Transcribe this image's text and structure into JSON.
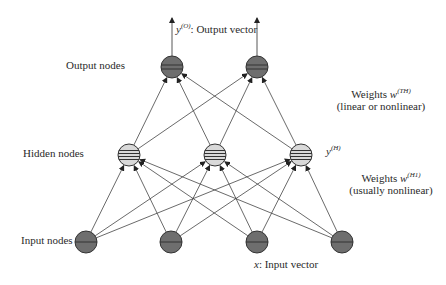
{
  "diagram": {
    "type": "neural-network",
    "title": "",
    "colors": {
      "node_dark": "#6e6e6e",
      "node_light": "#d9d9d9",
      "stroke": "#333333",
      "edge": "#444444"
    },
    "layers": {
      "output": {
        "label": "Output nodes",
        "nodes": [
          {
            "x": 172,
            "y": 67
          },
          {
            "x": 257,
            "y": 67
          }
        ],
        "vector_label": {
          "symbol": "y",
          "superscript": "(O)",
          "text": ": Output vector"
        }
      },
      "hidden": {
        "label": "Hidden nodes",
        "nodes": [
          {
            "x": 129,
            "y": 155
          },
          {
            "x": 215,
            "y": 155
          },
          {
            "x": 301,
            "y": 155
          }
        ],
        "vector_label": {
          "symbol": "y",
          "superscript": "(H)"
        }
      },
      "input": {
        "label": "Input nodes",
        "nodes": [
          {
            "x": 86,
            "y": 242
          },
          {
            "x": 171,
            "y": 242
          },
          {
            "x": 257,
            "y": 242
          },
          {
            "x": 342,
            "y": 242
          }
        ],
        "vector_label": {
          "symbol": "x",
          "text": ": Input vector"
        }
      }
    },
    "weights_top": {
      "prefix": "Weights ",
      "symbol": "w",
      "superscript": "(TH)",
      "note": "(linear or nonlinear)"
    },
    "weights_bottom": {
      "prefix": "Weights ",
      "symbol": "w",
      "superscript": "(H1)",
      "note": "(usually nonlinear)"
    },
    "node_radius": 11
  }
}
